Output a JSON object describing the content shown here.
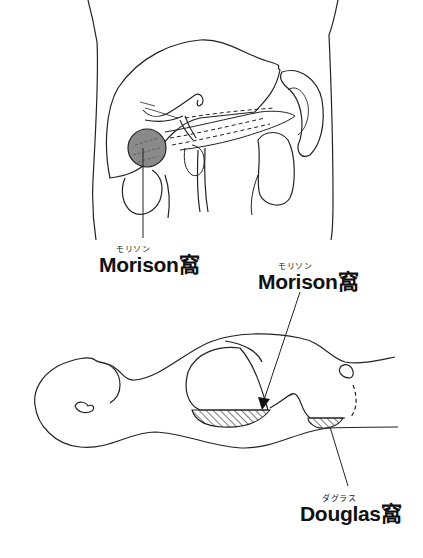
{
  "labels": {
    "morison_top": {
      "ruby": "モリソン",
      "text": "Morison窩"
    },
    "morison_side": {
      "ruby": "モリソン",
      "text": "Morison窩"
    },
    "douglas": {
      "ruby": "ダグラス",
      "text": "Douglas窩"
    }
  },
  "figures": {
    "top": "anterior-abdominal-organs-view",
    "bottom": "supine-body-lateral-view"
  },
  "colors": {
    "line": "#222222",
    "shade": "#7a7a7a",
    "background": "#ffffff"
  }
}
